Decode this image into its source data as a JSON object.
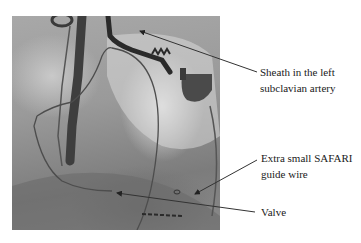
{
  "figure": {
    "type": "annotated fluoroscopy image",
    "annotations": [
      {
        "id": "sheath",
        "lines": [
          "Sheath in the left",
          "subclavian artery"
        ]
      },
      {
        "id": "guidewire",
        "lines": [
          "Extra small SAFARI",
          "guide wire"
        ]
      },
      {
        "id": "valve",
        "lines": [
          "Valve"
        ]
      }
    ],
    "colors": {
      "background": "#ffffff",
      "arrow": "#333333",
      "text": "#1a1a1a"
    }
  }
}
